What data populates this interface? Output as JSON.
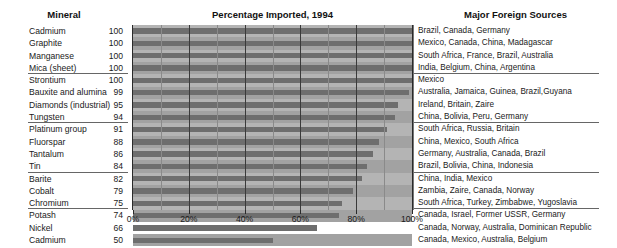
{
  "headers": {
    "mineral": "Mineral",
    "title": "Percentage Imported, 1994",
    "sources": "Major Foreign Sources"
  },
  "chart_data": {
    "type": "bar",
    "orientation": "horizontal",
    "title": "Percentage Imported, 1994",
    "xlabel": "",
    "ylabel": "Mineral",
    "xlim": [
      0,
      100
    ],
    "xticks": [
      "0%",
      "20%",
      "40%",
      "60%",
      "80%",
      "100%"
    ],
    "xtick_values": [
      0,
      20,
      40,
      60,
      80,
      100
    ],
    "minor_tick_interval": 10,
    "grid": true,
    "legend": "none",
    "categories": [
      "Cadmium",
      "Graphite",
      "Manganese",
      "Mica (sheet)",
      "Strontium",
      "Bauxite and alumina",
      "Diamonds (industrial)",
      "Tungsten",
      "Platinum group",
      "Fluorspar",
      "Tantalum",
      "Tin",
      "Barite",
      "Cobalt",
      "Chromium",
      "Potash",
      "Nickel",
      "Cadmium"
    ],
    "values": [
      100,
      100,
      100,
      100,
      100,
      99,
      95,
      94,
      91,
      88,
      86,
      84,
      82,
      79,
      75,
      74,
      66,
      50
    ],
    "group_breaks_after_index": [
      3,
      7,
      11,
      14
    ]
  },
  "rows": [
    {
      "mineral": "Cadmium",
      "value": 100,
      "sources": "Brazil, Canada, Germany",
      "group_end": false
    },
    {
      "mineral": "Graphite",
      "value": 100,
      "sources": "Mexico, Canada, China, Madagascar",
      "group_end": false
    },
    {
      "mineral": "Manganese",
      "value": 100,
      "sources": "South Africa, France, Brazil, Australia",
      "group_end": false
    },
    {
      "mineral": "Mica (sheet)",
      "value": 100,
      "sources": "India, Belgium, China, Argentina",
      "group_end": true
    },
    {
      "mineral": "Strontium",
      "value": 100,
      "sources": "Mexico",
      "group_end": false
    },
    {
      "mineral": "Bauxite and alumina",
      "value": 99,
      "sources": "Australia, Jamaica, Guinea, Brazil,Guyana",
      "group_end": false
    },
    {
      "mineral": "Diamonds (industrial)",
      "value": 95,
      "sources": "Ireland, Britain, Zaire",
      "group_end": false
    },
    {
      "mineral": "Tungsten",
      "value": 94,
      "sources": "China, Bolivia, Peru, Germany",
      "group_end": true
    },
    {
      "mineral": "Platinum group",
      "value": 91,
      "sources": "South Africa, Russia, Britain",
      "group_end": false
    },
    {
      "mineral": "Fluorspar",
      "value": 88,
      "sources": "China, Mexico, South Africa",
      "group_end": false
    },
    {
      "mineral": "Tantalum",
      "value": 86,
      "sources": "Germany, Australia, Canada, Brazil",
      "group_end": false
    },
    {
      "mineral": "Tin",
      "value": 84,
      "sources": "Brazil, Bolivia, China, Indonesia",
      "group_end": true
    },
    {
      "mineral": "Barite",
      "value": 82,
      "sources": "China, India, Mexico",
      "group_end": false
    },
    {
      "mineral": "Cobalt",
      "value": 79,
      "sources": "Zambia, Zaire, Canada, Norway",
      "group_end": false
    },
    {
      "mineral": "Chromium",
      "value": 75,
      "sources": "South Africa, Turkey, Zimbabwe, Yugoslavia",
      "group_end": true
    },
    {
      "mineral": "Potash",
      "value": 74,
      "sources": "Canada, Israel, Former USSR, Germany",
      "group_end": false
    },
    {
      "mineral": "Nickel",
      "value": 66,
      "sources": "Canada, Norway, Australia, Dominican Republic",
      "group_end": false
    },
    {
      "mineral": "Cadmium",
      "value": 50,
      "sources": "Canada, Mexico, Australia, Belgium",
      "group_end": false
    }
  ],
  "colors": {
    "bar": "#6e6e6e",
    "band_light": "#b4b4b4",
    "band_dark": "#a2a2a2",
    "gridline": "#3a3a3a",
    "text": "#1a1a1a"
  }
}
